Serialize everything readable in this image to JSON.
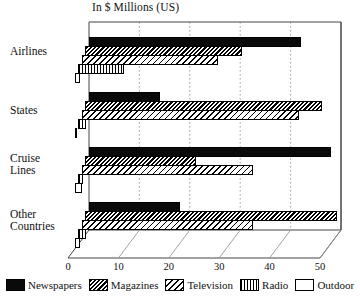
{
  "chart_data": {
    "type": "bar",
    "orientation": "horizontal",
    "style": "3d-grouped-horizontal-bar",
    "title": "In $ Millions (US)",
    "xlabel": "",
    "ylabel": "",
    "xlim": [
      0,
      50
    ],
    "xticks": [
      0,
      10,
      20,
      30,
      40,
      50
    ],
    "xtick_labels": [
      "0",
      "10",
      "20",
      "30",
      "40",
      "50"
    ],
    "grid": "vertical-dotted",
    "legend_position": "bottom",
    "categories": [
      "Airlines",
      "States",
      "Cruise\nLines",
      "Other\nCountries"
    ],
    "series": [
      {
        "name": "Newspapers",
        "pattern": "solid-black",
        "values": [
          42,
          14,
          48,
          18
        ]
      },
      {
        "name": "Magazines",
        "pattern": "dense-diagonal",
        "values": [
          31,
          47,
          22,
          50
        ]
      },
      {
        "name": "Television",
        "pattern": "sparse-diagonal",
        "values": [
          27,
          43,
          34,
          34
        ]
      },
      {
        "name": "Radio",
        "pattern": "vertical-stripes",
        "values": [
          9,
          1.5,
          1,
          1.5
        ]
      },
      {
        "name": "Outdoor",
        "pattern": "empty-white",
        "values": [
          1,
          0.3,
          1.5,
          1
        ]
      }
    ]
  },
  "legend": {
    "items": [
      {
        "label": "Newspapers"
      },
      {
        "label": "Magazines"
      },
      {
        "label": "Television"
      },
      {
        "label": "Radio"
      },
      {
        "label": "Outdoor"
      }
    ]
  },
  "colors": {
    "ink": "#000000",
    "background": "#ffffff",
    "gridline": "#999999",
    "frame": "#444444"
  }
}
